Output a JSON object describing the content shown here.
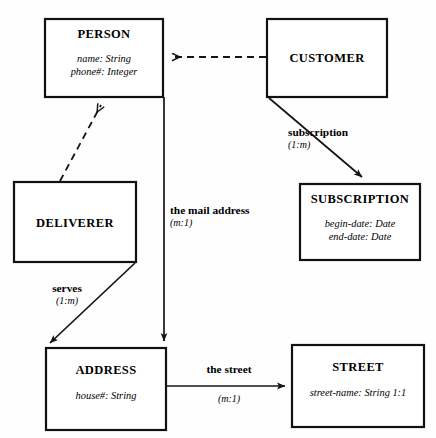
{
  "diagram": {
    "background_color": "#fefefe",
    "line_color": "#141414",
    "entities": [
      {
        "id": "person",
        "name": "PERSON",
        "attributes": [
          "name: String",
          "phone#: Integer"
        ],
        "x": 45,
        "y": 19,
        "w": 118,
        "h": 78
      },
      {
        "id": "customer",
        "name": "CUSTOMER",
        "attributes": [],
        "x": 267,
        "y": 19,
        "w": 120,
        "h": 78
      },
      {
        "id": "deliverer",
        "name": "DELIVERER",
        "attributes": [],
        "x": 14,
        "y": 182,
        "w": 122,
        "h": 80
      },
      {
        "id": "subscription",
        "name": "SUBSCRIPTION",
        "attributes": [
          "begin-date: Date",
          "end-date: Date"
        ],
        "x": 300,
        "y": 184,
        "w": 120,
        "h": 76
      },
      {
        "id": "address",
        "name": "ADDRESS",
        "attributes": [
          "house#: String"
        ],
        "x": 46,
        "y": 348,
        "w": 120,
        "h": 82
      },
      {
        "id": "street",
        "name": "STREET",
        "attributes": [
          "street-name: String  1:1"
        ],
        "x": 292,
        "y": 345,
        "w": 132,
        "h": 82
      }
    ],
    "relationships": [
      {
        "id": "customer-is-person",
        "from": "customer",
        "to": "person",
        "style": "dashed",
        "arrow": "open",
        "label": "",
        "cardinality": ""
      },
      {
        "id": "deliverer-is-person",
        "from": "deliverer",
        "to": "person",
        "style": "dashed",
        "arrow": "open",
        "label": "",
        "cardinality": ""
      },
      {
        "id": "subscription-rel",
        "from": "customer",
        "to": "subscription",
        "style": "solid",
        "arrow": "filled",
        "label": "subscription",
        "cardinality": "(1:m)"
      },
      {
        "id": "mail-address-rel",
        "from": "person",
        "to": "address",
        "style": "solid",
        "arrow": "filled",
        "label": "the mail address",
        "cardinality": "(m:1)"
      },
      {
        "id": "serves-rel",
        "from": "deliverer",
        "to": "address",
        "style": "solid",
        "arrow": "filled",
        "label": "serves",
        "cardinality": "(1:m)"
      },
      {
        "id": "street-rel",
        "from": "address",
        "to": "street",
        "style": "solid",
        "arrow": "filled",
        "label": "the street",
        "cardinality": "(m:1)"
      }
    ]
  }
}
